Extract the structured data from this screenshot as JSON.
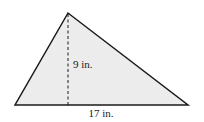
{
  "figure": {
    "type": "triangle",
    "fill_color": "#ececec",
    "stroke_color": "#1a1a1a",
    "vertices": {
      "apex": [
        68,
        13
      ],
      "base_left": [
        15,
        105
      ],
      "base_right": [
        188,
        105
      ]
    },
    "height_line": {
      "style": "dashed",
      "x": 68,
      "y1": 13,
      "y2": 105
    }
  },
  "labels": {
    "height": "9 in.",
    "base": "17 in."
  }
}
